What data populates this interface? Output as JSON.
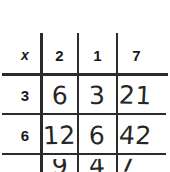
{
  "document": {
    "kind": "handwritten-multiplication-table",
    "corner_label": "x"
  },
  "table": {
    "corner": "x",
    "column_headers": [
      "2",
      "1",
      "7"
    ],
    "row_headers": [
      "3",
      "6"
    ],
    "rows": [
      {
        "header": "3",
        "cells": [
          "6",
          "3",
          "21"
        ]
      },
      {
        "header": "6",
        "cells": [
          "12",
          "6",
          "42"
        ]
      }
    ],
    "partial_row": {
      "header": "",
      "cells": [
        "9",
        "4",
        "7"
      ],
      "note": "cut off at bottom edge of image"
    }
  },
  "style": {
    "ink_color": "#2b2b2b",
    "text_color": "#1a1a1a",
    "hand_text_color": "#262626",
    "paper_color": "#ffffff"
  }
}
